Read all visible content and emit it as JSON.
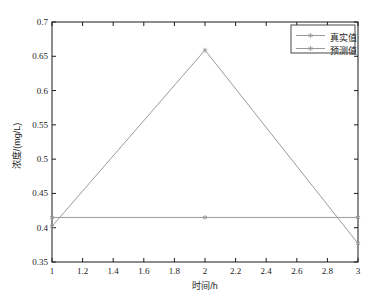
{
  "chart_data": {
    "type": "line",
    "title": "",
    "xlabel": "时间/h",
    "ylabel": "浓度/(mg/L)",
    "xlim": [
      1,
      3
    ],
    "ylim": [
      0.35,
      0.7
    ],
    "xticks": [
      "1",
      "1.2",
      "1.4",
      "1.6",
      "1.8",
      "2",
      "2.2",
      "2.4",
      "2.6",
      "2.8",
      "3"
    ],
    "xtick_values": [
      1,
      1.2,
      1.4,
      1.6,
      1.8,
      2,
      2.2,
      2.4,
      2.6,
      2.8,
      3
    ],
    "yticks": [
      "0.35",
      "0.4",
      "0.45",
      "0.5",
      "0.55",
      "0.6",
      "0.65",
      "0.7"
    ],
    "ytick_values": [
      0.35,
      0.4,
      0.45,
      0.5,
      0.55,
      0.6,
      0.65,
      0.7
    ],
    "grid": false,
    "legend_position": "top-right",
    "x": [
      1,
      2,
      3
    ],
    "series": [
      {
        "name": "真实值",
        "values": [
          0.415,
          0.415,
          0.415
        ],
        "color": "#9a9a9a",
        "marker": "asterisk"
      },
      {
        "name": "预测值",
        "values": [
          0.402,
          0.659,
          0.377
        ],
        "color": "#9a9a9a",
        "marker": "asterisk"
      }
    ]
  },
  "legend": {
    "entries": [
      {
        "label": "真实值"
      },
      {
        "label": "预测值"
      }
    ]
  },
  "axes": {
    "x_title": "时间/h",
    "y_title": "浓度/(mg/L)"
  },
  "colors": {
    "axis": "#1b1b1b",
    "series_true": "#9a9a9a",
    "series_pred": "#9a9a9a",
    "background": "#ffffff"
  }
}
